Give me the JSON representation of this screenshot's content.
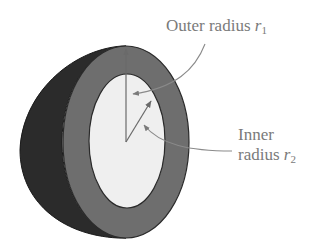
{
  "diagram": {
    "colors": {
      "background": "#ffffff",
      "back_hemisphere": "#2b2b2b",
      "shell_ring": "#6e6e6e",
      "inner_cavity": "#efefef",
      "arrows": "#6a6a6a",
      "leader_lines": "#8a8a8a",
      "label_text": "#7a7a7a"
    },
    "labels": {
      "outer": {
        "text": "Outer radius ",
        "symbol": "r",
        "subscript": "1"
      },
      "inner_line1": "Inner",
      "inner_line2": {
        "text": "radius ",
        "symbol": "r",
        "subscript": "2"
      }
    },
    "arrows": [
      {
        "name": "outer-radius-vector",
        "from": [
          126,
          142
        ],
        "to": [
          126,
          48
        ]
      },
      {
        "name": "inner-radius-vector",
        "from": [
          126,
          142
        ],
        "to": [
          152,
          100
        ]
      }
    ]
  }
}
